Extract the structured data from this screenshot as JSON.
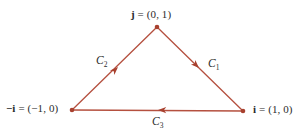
{
  "figure": {
    "width": 306,
    "height": 133,
    "background_color": "#ffffff",
    "stroke_color": "#b5503f",
    "text_color": "#2b2b2b"
  },
  "vertices": [
    {
      "id": "apex",
      "name": "j",
      "label_vector": "j",
      "label_equals": " = (0, 1)",
      "label_full": "j = (0, 1)",
      "coordinates": [
        0,
        1
      ],
      "px": [
        157,
        27
      ]
    },
    {
      "id": "left",
      "name": "minus-i",
      "label_vector": "−i",
      "label_equals": " = (−1, 0)",
      "label_full": "−i = (−1, 0)",
      "coordinates": [
        -1,
        0
      ],
      "px": [
        72,
        110
      ]
    },
    {
      "id": "right",
      "name": "i",
      "label_vector": "i",
      "label_equals": " = (1, 0)",
      "label_full": "i = (1, 0)",
      "coordinates": [
        1,
        0
      ],
      "px": [
        243,
        111
      ]
    }
  ],
  "edges": [
    {
      "id": "c1",
      "label_base": "C",
      "label_sub": "1",
      "label_full": "C₁",
      "from": "i",
      "to": "j",
      "arrow_px": [
        199,
        68
      ],
      "arrow_direction": "up-left"
    },
    {
      "id": "c2",
      "label_base": "C",
      "label_sub": "2",
      "label_full": "C₂",
      "from": "j",
      "to": "minus-i",
      "arrow_px": [
        118,
        67
      ],
      "arrow_direction": "down-left"
    },
    {
      "id": "c3",
      "label_base": "C",
      "label_sub": "3",
      "label_full": "C₃",
      "from": "minus-i",
      "to": "i",
      "arrow_px": [
        158,
        110
      ],
      "arrow_direction": "right"
    }
  ]
}
